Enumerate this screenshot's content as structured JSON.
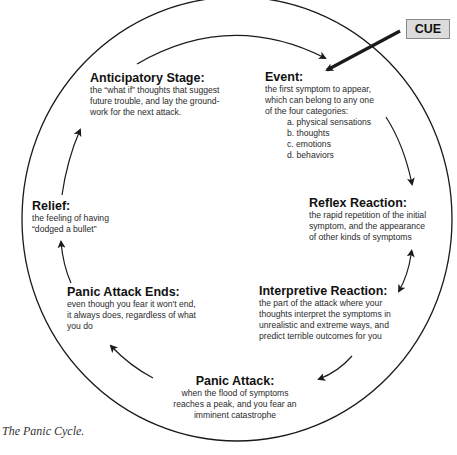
{
  "diagram": {
    "title": "The Panic Cycle",
    "cue": {
      "label": "CUE"
    },
    "stages": [
      {
        "id": "event",
        "title": "Event:",
        "description": "the first symptom to appear, which can belong to any one of the four categories:",
        "lines": [
          "the first symptom to appear,",
          "which can belong to any one",
          "of the four categories:"
        ],
        "categories": [
          "a. physical sensations",
          "b. thoughts",
          "c. emotions",
          "d. behaviors"
        ]
      },
      {
        "id": "reflex-reaction",
        "title": "Reflex Reaction:",
        "lines": [
          "the rapid repetition of the initial",
          "symptom, and the appearance",
          "of other kinds of symptoms"
        ]
      },
      {
        "id": "interpretive-reaction",
        "title": "Interpretive Reaction:",
        "lines": [
          "the part of the attack where your",
          "thoughts interpret the symptoms in",
          "unrealistic and extreme ways, and",
          "predict terrible outcomes for you"
        ]
      },
      {
        "id": "panic-attack",
        "title": "Panic Attack:",
        "lines": [
          "when the flood of symptoms",
          "reaches a peak, and you fear an",
          "imminent catastrophe"
        ]
      },
      {
        "id": "panic-attack-ends",
        "title": "Panic Attack Ends:",
        "lines": [
          "even though you fear it won't end,",
          "it always does, regardless of what",
          "you do"
        ]
      },
      {
        "id": "relief",
        "title": "Relief:",
        "lines": [
          "the feeling of having",
          "“dodged a bullet”"
        ]
      },
      {
        "id": "anticipatory-stage",
        "title": "Anticipatory Stage:",
        "lines": [
          "the “what if” thoughts that suggest",
          "future trouble, and lay the ground-",
          "work for the next attack."
        ]
      }
    ],
    "caption": "The Panic Cycle."
  },
  "colors": {
    "line": "#1a1a1a",
    "cue_fill": "#dcdcdc",
    "cue_border": "#888888"
  }
}
